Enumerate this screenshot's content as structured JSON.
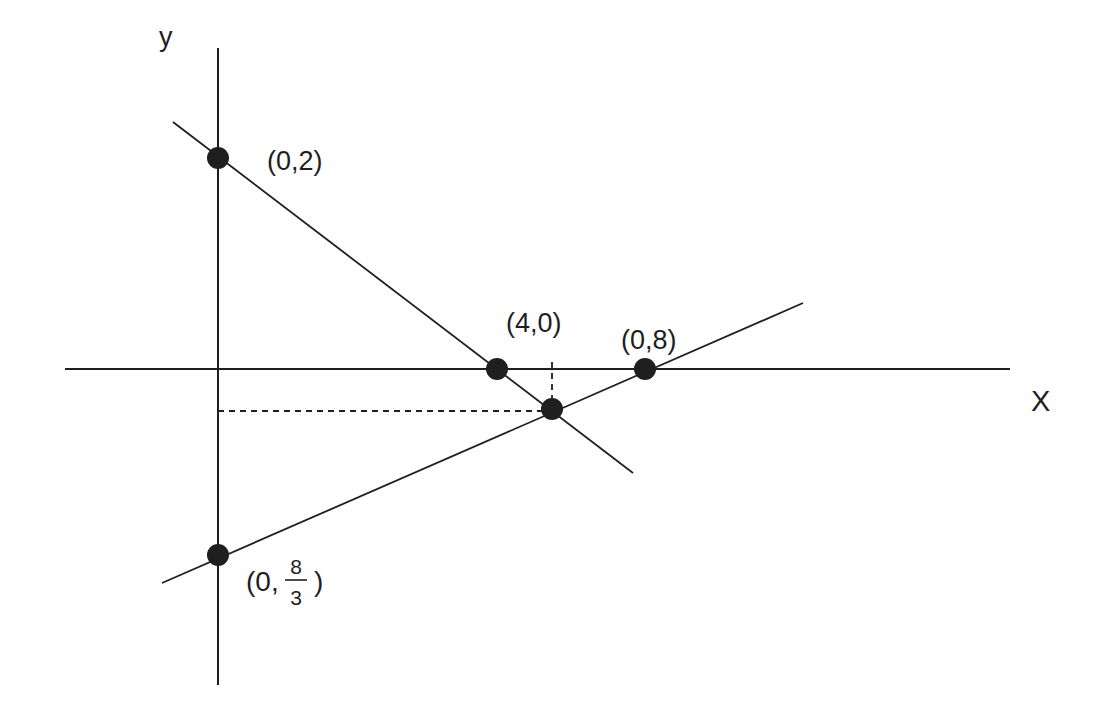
{
  "figure": {
    "background_color": "#ffffff",
    "ink_color": "#1f1f1f",
    "axes": {
      "y_label": "y",
      "x_label": "X"
    },
    "point_labels": {
      "p_0_2": "(0,2)",
      "p_4_0": "(4,0)",
      "p_0_8": "(0,8)",
      "p_0_8_3_prefix": "(0,",
      "p_0_8_3_numerator": "8",
      "p_0_8_3_denominator": "3",
      "p_0_8_3_suffix": ")"
    }
  }
}
